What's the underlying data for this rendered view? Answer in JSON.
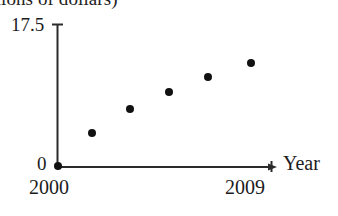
{
  "figure": {
    "caption_cropped": "millions of dollars)",
    "background_color": "#ffffff",
    "ink_color": "#1a1a1a",
    "marker_color": "#111111"
  },
  "axes": {
    "y_top_label": "17.5",
    "y_bottom_label": "0",
    "x_start_label": "2000",
    "x_end_label": "2009",
    "x_axis_title": "Year"
  },
  "chart_data": {
    "type": "scatter",
    "title": "",
    "subtitle": "",
    "xlabel": "Year",
    "ylabel": "millions of dollars)",
    "xlim": [
      2000,
      2009
    ],
    "ylim": [
      0,
      17.5
    ],
    "grid": false,
    "legend": null,
    "x_tick_labels": [
      "2000",
      "2009"
    ],
    "y_tick_labels": [
      "0",
      "17.5"
    ],
    "x": [
      2000,
      2001.5,
      2003,
      2004.5,
      2006,
      2007.8
    ],
    "y": [
      0.0,
      4.0,
      7.0,
      9.1,
      11.0,
      12.6
    ],
    "points": [
      {
        "x": 2000,
        "y": 0.0,
        "px": 58,
        "py": 166
      },
      {
        "x": 2001.5,
        "y": 4.0,
        "px": 92,
        "py": 133
      },
      {
        "x": 2003,
        "y": 7.0,
        "px": 130,
        "py": 109
      },
      {
        "x": 2004.5,
        "y": 9.1,
        "px": 169,
        "py": 92
      },
      {
        "x": 2006,
        "y": 11.0,
        "px": 208,
        "py": 77
      },
      {
        "x": 2007.8,
        "y": 12.6,
        "px": 251,
        "py": 63
      }
    ],
    "marker": "filled-circle",
    "marker_radius_px": 4
  }
}
